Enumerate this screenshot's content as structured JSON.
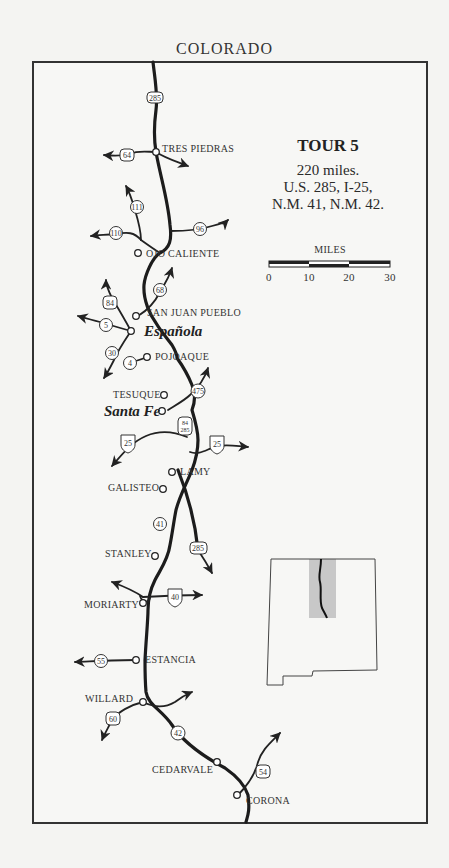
{
  "header": {
    "north_label": "COLORADO"
  },
  "tour": {
    "title": "TOUR 5",
    "distance": "220 miles.",
    "routes_line1": "U.S. 285, I-25,",
    "routes_line2": "N.M. 41, N.M. 42."
  },
  "scale": {
    "label": "MILES",
    "ticks": [
      "0",
      "10",
      "20",
      "30"
    ]
  },
  "towns": [
    {
      "name": "TRES PIEDRAS"
    },
    {
      "name": "OJO CALIENTE"
    },
    {
      "name": "SAN JUAN PUEBLO"
    },
    {
      "name": "Española"
    },
    {
      "name": "POJOAQUE"
    },
    {
      "name": "TESUQUE"
    },
    {
      "name": "Santa Fe"
    },
    {
      "name": "LAMY"
    },
    {
      "name": "GALISTEO"
    },
    {
      "name": "STANLEY"
    },
    {
      "name": "MORIARTY"
    },
    {
      "name": "ESTANCIA"
    },
    {
      "name": "WILLARD"
    },
    {
      "name": "CEDARVALE"
    },
    {
      "name": "CORONA"
    }
  ],
  "shields": {
    "us285_top": "285",
    "us64": "64",
    "nm111": "111",
    "nm110": "110",
    "nm96": "96",
    "nm68": "68",
    "us84": "84",
    "nm5": "5",
    "nm30": "30",
    "nm4": "4",
    "nm475": "475",
    "us84_285_a": "84",
    "us84_285_b": "285",
    "i25_west": "25",
    "i25_east": "25",
    "nm41": "41",
    "us285_south": "285",
    "i40": "40",
    "nm55": "55",
    "us60": "60",
    "nm42": "42",
    "us54": "54"
  }
}
